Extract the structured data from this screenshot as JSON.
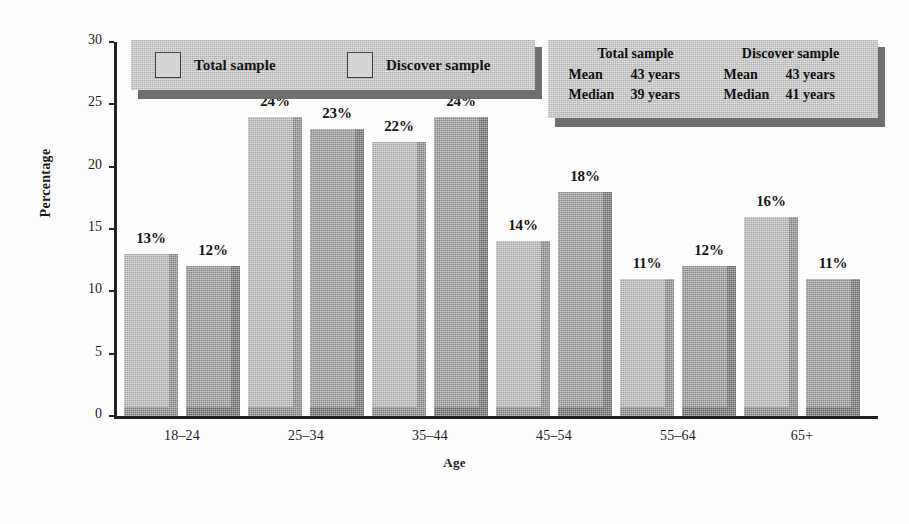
{
  "chart_data": {
    "type": "bar",
    "title": "",
    "xlabel": "Age",
    "ylabel": "Percentage",
    "ylim": [
      0,
      30
    ],
    "yticks": [
      "0",
      "5",
      "10",
      "15",
      "20",
      "25",
      "30"
    ],
    "grid": false,
    "legend_position": "top-left",
    "categories": [
      "18–24",
      "25–34",
      "35–44",
      "45–54",
      "55–64",
      "65+"
    ],
    "series": [
      {
        "name": "Total sample",
        "values": [
          13,
          24,
          22,
          14,
          11,
          16
        ],
        "labels": [
          "13%",
          "24%",
          "22%",
          "14%",
          "11%",
          "16%"
        ],
        "color": "#b9b9b9"
      },
      {
        "name": "Discover sample",
        "values": [
          12,
          23,
          24,
          18,
          12,
          11
        ],
        "labels": [
          "12%",
          "23%",
          "24%",
          "18%",
          "12%",
          "11%"
        ],
        "color": "#9a9a9a"
      }
    ]
  },
  "legend": {
    "entries": [
      {
        "label": "Total sample",
        "swatch": "#d3d3d3"
      },
      {
        "label": "Discover sample",
        "swatch": "#d3d3d3"
      }
    ]
  },
  "stats_panel": {
    "columns": [
      {
        "heading": "Total sample",
        "rows": [
          {
            "key": "Mean",
            "value": "43 years"
          },
          {
            "key": "Median",
            "value": "39 years"
          }
        ]
      },
      {
        "heading": "Discover sample",
        "rows": [
          {
            "key": "Mean",
            "value": "43 years"
          },
          {
            "key": "Median",
            "value": "41 years"
          }
        ]
      }
    ]
  }
}
